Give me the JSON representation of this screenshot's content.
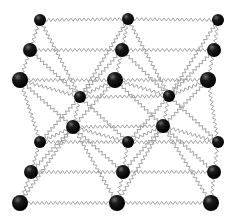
{
  "figure": {
    "title": "Ball-and-spring crystal lattice model",
    "spring_color": "#9a9a9a",
    "atom_color": "#111111",
    "background": "#ffffff"
  },
  "atoms": [
    {
      "x": 40,
      "y": 20,
      "r": 6
    },
    {
      "x": 128,
      "y": 19,
      "r": 6
    },
    {
      "x": 218,
      "y": 20,
      "r": 6
    },
    {
      "x": 30,
      "y": 50,
      "r": 7
    },
    {
      "x": 122,
      "y": 50,
      "r": 7
    },
    {
      "x": 214,
      "y": 50,
      "r": 7
    },
    {
      "x": 20,
      "y": 80,
      "r": 8
    },
    {
      "x": 115,
      "y": 80,
      "r": 8
    },
    {
      "x": 208,
      "y": 80,
      "r": 8
    },
    {
      "x": 80,
      "y": 97,
      "r": 6
    },
    {
      "x": 169,
      "y": 96,
      "r": 6
    },
    {
      "x": 73,
      "y": 127,
      "r": 7
    },
    {
      "x": 163,
      "y": 126,
      "r": 7
    },
    {
      "x": 40,
      "y": 142,
      "r": 6
    },
    {
      "x": 128,
      "y": 142,
      "r": 6
    },
    {
      "x": 218,
      "y": 142,
      "r": 6
    },
    {
      "x": 31,
      "y": 172,
      "r": 7
    },
    {
      "x": 123,
      "y": 172,
      "r": 7
    },
    {
      "x": 214,
      "y": 172,
      "r": 7
    },
    {
      "x": 20,
      "y": 203,
      "r": 8
    },
    {
      "x": 117,
      "y": 203,
      "r": 8
    },
    {
      "x": 211,
      "y": 203,
      "r": 8
    }
  ],
  "bonds": [
    [
      0,
      1
    ],
    [
      1,
      2
    ],
    [
      3,
      4
    ],
    [
      4,
      5
    ],
    [
      6,
      7
    ],
    [
      7,
      8
    ],
    [
      0,
      3
    ],
    [
      3,
      6
    ],
    [
      1,
      4
    ],
    [
      4,
      7
    ],
    [
      2,
      5
    ],
    [
      5,
      8
    ],
    [
      13,
      14
    ],
    [
      14,
      15
    ],
    [
      16,
      17
    ],
    [
      17,
      18
    ],
    [
      19,
      20
    ],
    [
      20,
      21
    ],
    [
      13,
      16
    ],
    [
      16,
      19
    ],
    [
      14,
      17
    ],
    [
      17,
      20
    ],
    [
      15,
      18
    ],
    [
      18,
      21
    ],
    [
      9,
      10
    ],
    [
      11,
      12
    ],
    [
      9,
      11
    ],
    [
      10,
      12
    ],
    [
      0,
      9
    ],
    [
      1,
      9
    ],
    [
      3,
      9
    ],
    [
      4,
      9
    ],
    [
      6,
      9
    ],
    [
      7,
      9
    ],
    [
      1,
      10
    ],
    [
      2,
      10
    ],
    [
      4,
      10
    ],
    [
      5,
      10
    ],
    [
      7,
      10
    ],
    [
      8,
      10
    ],
    [
      13,
      11
    ],
    [
      14,
      11
    ],
    [
      16,
      11
    ],
    [
      17,
      11
    ],
    [
      19,
      11
    ],
    [
      20,
      11
    ],
    [
      14,
      12
    ],
    [
      15,
      12
    ],
    [
      17,
      12
    ],
    [
      18,
      12
    ],
    [
      20,
      12
    ],
    [
      21,
      12
    ],
    [
      6,
      11
    ],
    [
      7,
      11
    ],
    [
      7,
      12
    ],
    [
      8,
      12
    ],
    [
      9,
      13
    ],
    [
      9,
      14
    ],
    [
      10,
      14
    ],
    [
      10,
      15
    ],
    [
      6,
      13
    ],
    [
      8,
      15
    ]
  ]
}
